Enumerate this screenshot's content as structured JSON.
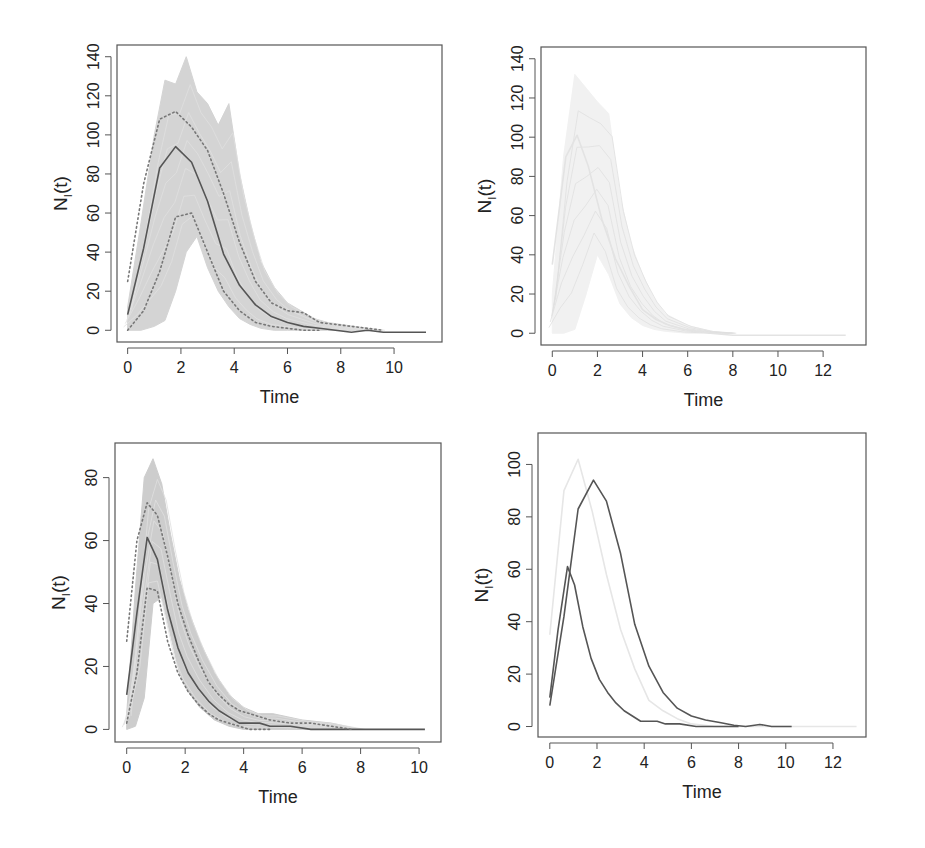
{
  "figure": {
    "background": "#ffffff",
    "colors": {
      "frame": "#555555",
      "mean_line": "#555555",
      "dotted_band": "#777777",
      "trajectories": "#cccccc",
      "faint_trajectories": "#ececec"
    }
  },
  "chart_data": [
    {
      "id": "top-left",
      "type": "line",
      "title": "",
      "xlabel": "Time",
      "ylabel": "N_I(t)",
      "ylabel_main": "N",
      "ylabel_sub": "I",
      "ylabel_tail": "(t)",
      "xlim": [
        -0.4,
        11.8
      ],
      "ylim": [
        -6,
        146
      ],
      "xticks": [
        0,
        2,
        4,
        6,
        8,
        10
      ],
      "yticks": [
        0,
        20,
        40,
        60,
        80,
        100,
        120,
        140
      ],
      "grid": false,
      "legend": null,
      "frame": {
        "x": 117,
        "y": 45,
        "w": 325,
        "h": 297
      },
      "series": [
        {
          "name": "simulated trajectories (envelope)",
          "style": "band",
          "color": "#d0d0d0",
          "x": [
            0,
            0.5,
            1.0,
            1.4,
            1.8,
            2.2,
            2.6,
            3.0,
            3.4,
            3.8,
            4.2,
            4.6,
            5.0,
            5.5,
            6.0,
            6.5,
            7.0,
            7.5,
            8.0,
            8.5,
            9.0,
            9.5
          ],
          "upper": [
            12,
            55,
            100,
            128,
            126,
            140,
            122,
            116,
            105,
            116,
            80,
            55,
            35,
            22,
            14,
            10,
            6,
            4,
            3,
            2,
            1,
            0
          ],
          "lower": [
            0,
            0,
            2,
            5,
            20,
            40,
            48,
            32,
            20,
            12,
            6,
            3,
            1,
            0,
            0,
            0,
            0,
            0,
            0,
            0,
            0,
            0
          ]
        },
        {
          "name": "mean",
          "style": "solid",
          "color": "#555555",
          "x": [
            0,
            0.6,
            1.2,
            1.8,
            2.4,
            3.0,
            3.6,
            4.2,
            4.8,
            5.4,
            6.0,
            6.6,
            7.2,
            7.8,
            8.4,
            9.0,
            9.6,
            10.2,
            11.2
          ],
          "y": [
            8,
            42,
            83,
            94,
            86,
            66,
            39,
            23,
            13,
            7,
            4,
            2,
            1,
            0,
            -1,
            0,
            -1,
            -1,
            -1
          ]
        },
        {
          "name": "upper quantile",
          "style": "dotted",
          "color": "#777777",
          "x": [
            0,
            0.6,
            1.2,
            1.8,
            2.4,
            3.0,
            3.6,
            4.2,
            4.8,
            5.4,
            6.0,
            6.6,
            7.2,
            7.8,
            8.4,
            9.0,
            9.6
          ],
          "y": [
            25,
            75,
            108,
            112,
            104,
            92,
            70,
            45,
            25,
            14,
            10,
            9,
            4,
            3,
            2,
            1,
            0
          ]
        },
        {
          "name": "lower quantile",
          "style": "dotted",
          "color": "#777777",
          "x": [
            0,
            0.6,
            1.2,
            1.8,
            2.4,
            3.0,
            3.6,
            4.2,
            4.8,
            5.4,
            6.0,
            6.6,
            7.2
          ],
          "y": [
            0,
            10,
            30,
            58,
            60,
            40,
            20,
            10,
            4,
            2,
            1,
            0,
            0
          ]
        }
      ]
    },
    {
      "id": "top-right",
      "type": "line",
      "title": "",
      "xlabel": "Time",
      "ylabel": "N_I(t)",
      "ylabel_main": "N",
      "ylabel_sub": "I",
      "ylabel_tail": "(t)",
      "xlim": [
        -0.5,
        13.9
      ],
      "ylim": [
        -6,
        146
      ],
      "xticks": [
        0,
        2,
        4,
        6,
        8,
        10,
        12
      ],
      "yticks": [
        0,
        20,
        40,
        60,
        80,
        100,
        120,
        140
      ],
      "grid": false,
      "legend": null,
      "frame": {
        "x": 541,
        "y": 47,
        "w": 325,
        "h": 298
      },
      "series": [
        {
          "name": "simulated trajectories (envelope, very faint)",
          "style": "band",
          "color": "#f0f0f0",
          "x": [
            0,
            0.5,
            1.0,
            1.5,
            2.0,
            2.5,
            3.0,
            3.5,
            4.0,
            4.5,
            5.0,
            6.0,
            7.0,
            8.0
          ],
          "upper": [
            20,
            90,
            132,
            125,
            118,
            112,
            70,
            45,
            30,
            18,
            10,
            4,
            1,
            0
          ],
          "lower": [
            0,
            0,
            2,
            20,
            40,
            30,
            15,
            8,
            4,
            2,
            1,
            0,
            0,
            0
          ]
        },
        {
          "name": "mean",
          "style": "solid",
          "color": "#e3e3e3",
          "x": [
            0,
            0.6,
            1.1,
            1.6,
            2.2,
            2.8,
            3.4,
            4.0,
            4.6,
            5.2,
            5.8,
            6.4,
            7.0,
            8.0,
            9.0,
            10.0,
            11.0,
            12.0,
            13.0
          ],
          "y": [
            35,
            90,
            101,
            85,
            58,
            38,
            24,
            12,
            7,
            4,
            2,
            1,
            0,
            -1,
            -1,
            -1,
            -1,
            -1,
            -1
          ]
        }
      ]
    },
    {
      "id": "bottom-left",
      "type": "line",
      "title": "",
      "xlabel": "Time",
      "ylabel": "N_I(t)",
      "ylabel_main": "N",
      "ylabel_sub": "I",
      "ylabel_tail": "(t)",
      "xlim": [
        -0.4,
        10.75
      ],
      "ylim": [
        -4,
        91
      ],
      "xticks": [
        0,
        2,
        4,
        6,
        8,
        10
      ],
      "yticks": [
        0,
        20,
        40,
        60,
        80
      ],
      "grid": false,
      "legend": null,
      "frame": {
        "x": 115,
        "y": 443,
        "w": 326,
        "h": 299
      },
      "series": [
        {
          "name": "simulated trajectories (envelope)",
          "style": "band",
          "color": "#c8c8c8",
          "x": [
            0,
            0.3,
            0.6,
            0.9,
            1.2,
            1.5,
            1.8,
            2.1,
            2.5,
            3.0,
            3.5,
            4.0,
            4.5,
            5.0,
            5.5,
            6.0,
            7.0,
            8.0
          ],
          "upper": [
            5,
            45,
            80,
            86,
            78,
            62,
            48,
            38,
            28,
            18,
            11,
            7,
            5,
            5,
            4,
            3,
            2,
            0
          ],
          "lower": [
            0,
            1,
            10,
            40,
            42,
            30,
            18,
            12,
            7,
            3,
            1,
            0,
            0,
            0,
            0,
            0,
            0,
            0
          ]
        },
        {
          "name": "mean",
          "style": "solid",
          "color": "#555555",
          "x": [
            0,
            0.35,
            0.7,
            1.05,
            1.4,
            1.75,
            2.1,
            2.45,
            2.8,
            3.15,
            3.5,
            3.85,
            4.2,
            4.55,
            4.9,
            5.6,
            6.3,
            7.0,
            8.0,
            9.0,
            10.2
          ],
          "y": [
            11,
            37,
            61,
            54,
            38,
            26,
            18,
            13,
            9,
            6,
            4,
            2,
            2,
            2,
            1,
            1,
            0,
            0,
            0,
            0,
            0
          ]
        },
        {
          "name": "upper quantile",
          "style": "dotted",
          "color": "#777777",
          "x": [
            0,
            0.35,
            0.7,
            1.05,
            1.4,
            1.75,
            2.1,
            2.45,
            2.8,
            3.15,
            3.5,
            3.85,
            4.2,
            4.9,
            5.6,
            6.3,
            7.0,
            7.7
          ],
          "y": [
            28,
            60,
            72,
            68,
            55,
            40,
            30,
            22,
            15,
            11,
            8,
            6,
            5,
            3,
            2,
            2,
            1,
            0
          ]
        },
        {
          "name": "lower quantile",
          "style": "dotted",
          "color": "#777777",
          "x": [
            0,
            0.35,
            0.7,
            1.05,
            1.4,
            1.75,
            2.1,
            2.45,
            2.8,
            3.15,
            3.5,
            3.85,
            4.2,
            4.9
          ],
          "y": [
            2,
            18,
            45,
            44,
            28,
            18,
            12,
            8,
            5,
            3,
            2,
            1,
            0,
            0
          ]
        }
      ]
    },
    {
      "id": "bottom-right",
      "type": "line",
      "title": "",
      "xlabel": "Time",
      "ylabel": "N_I(t)",
      "ylabel_main": "N",
      "ylabel_sub": "I",
      "ylabel_tail": "(t)",
      "xlim": [
        -0.5,
        13.4
      ],
      "ylim": [
        -4,
        112
      ],
      "xticks": [
        0,
        2,
        4,
        6,
        8,
        10,
        12
      ],
      "yticks": [
        0,
        20,
        40,
        60,
        80,
        100
      ],
      "grid": false,
      "legend": null,
      "frame": {
        "x": 538,
        "y": 433,
        "w": 328,
        "h": 304
      },
      "series": [
        {
          "name": "mean (top-right scenario)",
          "style": "solid",
          "color": "#e6e6e6",
          "x": [
            0,
            0.6,
            1.2,
            1.8,
            2.4,
            3.0,
            3.6,
            4.2,
            4.8,
            5.4,
            6.0,
            7.0,
            8.0,
            9.0,
            10.0,
            11.0,
            12.0,
            13.0
          ],
          "y": [
            35,
            90,
            102,
            82,
            58,
            37,
            22,
            10,
            6,
            3,
            1,
            0,
            0,
            0,
            0,
            0,
            0,
            0
          ]
        },
        {
          "name": "mean (top-left scenario)",
          "style": "solid",
          "color": "#555555",
          "x": [
            0,
            0.6,
            1.2,
            1.85,
            2.4,
            3.0,
            3.6,
            4.2,
            4.8,
            5.4,
            6.0,
            6.6,
            7.2,
            7.8,
            8.3,
            8.9,
            9.4,
            10.25
          ],
          "y": [
            8,
            42,
            83,
            94,
            86,
            66,
            39,
            23,
            13,
            7,
            4,
            2.5,
            1.5,
            0.5,
            0,
            0.8,
            0,
            0
          ]
        },
        {
          "name": "mean (bottom-left scenario)",
          "style": "solid",
          "color": "#555555",
          "x": [
            0,
            0.35,
            0.75,
            1.05,
            1.4,
            1.75,
            2.1,
            2.45,
            2.8,
            3.15,
            3.5,
            3.85,
            4.2,
            4.55,
            4.9,
            5.5,
            6.2,
            7.0,
            8.0
          ],
          "y": [
            11,
            37,
            61,
            54,
            38,
            26,
            18,
            13,
            9,
            6,
            4,
            2,
            2,
            2,
            1,
            1,
            0,
            0,
            0
          ]
        }
      ]
    }
  ]
}
